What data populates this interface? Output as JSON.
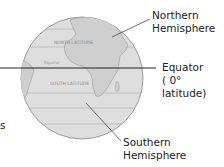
{
  "diagram": {
    "globe": {
      "grid_labels": [
        "NORTH LATITUDE",
        "SOUTH LATITUDE",
        "Equator"
      ],
      "fill_color": "#dcdcdc",
      "land_color": "#c8c8c8"
    },
    "labels": {
      "northern": [
        "Northern",
        "Hemisphere"
      ],
      "equator": [
        "Equator",
        "( 0° latitude)"
      ],
      "southern": [
        "Southern",
        "Hemisphere"
      ],
      "edge_fragment": "s"
    }
  }
}
